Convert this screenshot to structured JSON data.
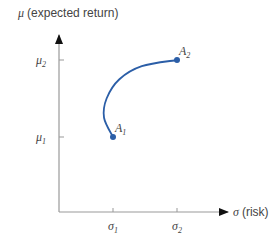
{
  "chart_data": {
    "type": "line",
    "title": "",
    "ylabel": "(expected return)",
    "ylabel_symbol": "μ",
    "xlabel": "(risk)",
    "xlabel_symbol": "σ",
    "x_ticks": [
      {
        "symbol": "σ",
        "sub": "1",
        "value": 1
      },
      {
        "symbol": "σ",
        "sub": "2",
        "value": 2
      }
    ],
    "y_ticks": [
      {
        "symbol": "μ",
        "sub": "1",
        "value": 1
      },
      {
        "symbol": "μ",
        "sub": "2",
        "value": 2
      }
    ],
    "xlim": [
      0,
      3
    ],
    "ylim": [
      0,
      3
    ],
    "grid": false,
    "series": [
      {
        "name": "efficient frontier",
        "color": "#2b5ea7",
        "curve": [
          [
            1.0,
            1.0
          ],
          [
            0.86,
            1.25
          ],
          [
            0.9,
            1.5
          ],
          [
            1.1,
            1.75
          ],
          [
            1.45,
            1.92
          ],
          [
            2.0,
            2.0
          ]
        ]
      }
    ],
    "points": [
      {
        "label": "A",
        "sub": "1",
        "x": 1,
        "y": 1
      },
      {
        "label": "A",
        "sub": "2",
        "x": 2,
        "y": 2
      }
    ]
  }
}
